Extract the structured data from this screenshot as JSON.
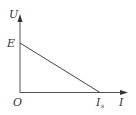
{
  "diagram": {
    "type": "U-I characteristic graph",
    "axes": {
      "y_label": "U",
      "x_label": "I",
      "origin_label": "O"
    },
    "points": {
      "y_intercept_label": "E",
      "x_intercept_label": "I",
      "x_intercept_subscript": "s"
    },
    "colors": {
      "line": "#444444",
      "background": "#ffffff"
    }
  }
}
